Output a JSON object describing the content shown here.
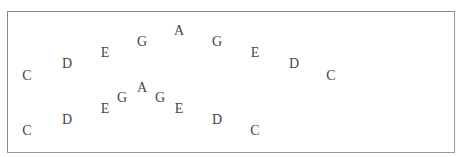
{
  "panel": {
    "border_color": "#8a8a8a",
    "text_color": "#444444"
  },
  "sequences": [
    {
      "name": "upper-arc",
      "notes": [
        {
          "label": "C",
          "x": 27,
          "y": 76
        },
        {
          "label": "D",
          "x": 67,
          "y": 64
        },
        {
          "label": "E",
          "x": 105,
          "y": 53
        },
        {
          "label": "G",
          "x": 142,
          "y": 42
        },
        {
          "label": "A",
          "x": 179,
          "y": 31
        },
        {
          "label": "G",
          "x": 217,
          "y": 42
        },
        {
          "label": "E",
          "x": 255,
          "y": 53
        },
        {
          "label": "D",
          "x": 294,
          "y": 64
        },
        {
          "label": "C",
          "x": 331,
          "y": 76
        }
      ]
    },
    {
      "name": "lower-arc",
      "notes": [
        {
          "label": "C",
          "x": 27,
          "y": 131
        },
        {
          "label": "D",
          "x": 67,
          "y": 120
        },
        {
          "label": "E",
          "x": 105,
          "y": 109
        },
        {
          "label": "G",
          "x": 122,
          "y": 98
        },
        {
          "label": "A",
          "x": 142,
          "y": 88
        },
        {
          "label": "G",
          "x": 160,
          "y": 98
        },
        {
          "label": "E",
          "x": 179,
          "y": 109
        },
        {
          "label": "D",
          "x": 217,
          "y": 120
        },
        {
          "label": "C",
          "x": 255,
          "y": 131
        }
      ]
    }
  ]
}
